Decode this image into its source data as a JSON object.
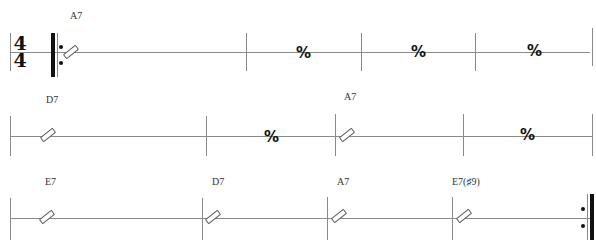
{
  "time_signature": {
    "top": "4",
    "bottom": "4"
  },
  "systems": [
    {
      "measures": [
        {
          "chord": "A7",
          "content": "slash"
        },
        {
          "chord": "",
          "content": "repeat"
        },
        {
          "chord": "",
          "content": "repeat"
        },
        {
          "chord": "",
          "content": "repeat"
        }
      ]
    },
    {
      "measures": [
        {
          "chord": "D7",
          "content": "slash"
        },
        {
          "chord": "",
          "content": "repeat"
        },
        {
          "chord": "A7",
          "content": "slash"
        },
        {
          "chord": "",
          "content": "repeat"
        }
      ]
    },
    {
      "measures": [
        {
          "chord": "E7",
          "content": "slash"
        },
        {
          "chord": "D7",
          "content": "slash"
        },
        {
          "chord": "A7",
          "content": "slash"
        },
        {
          "chord": "E7(♯9)",
          "content": "slash"
        }
      ]
    }
  ],
  "symbols": {
    "repeat_measure": "𝄎",
    "repeat_measure_fallback": "%",
    "start_repeat": "start-repeat",
    "end_repeat": "end-repeat"
  },
  "chords": {
    "s1m1": "A7",
    "s2m1": "D7",
    "s2m3": "A7",
    "s3m1": "E7",
    "s3m2": "D7",
    "s3m3": "A7",
    "s3m4": "E7(♯9)"
  },
  "repeat_glyph": "%"
}
